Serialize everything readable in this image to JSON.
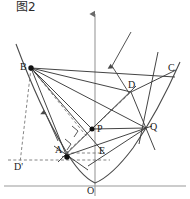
{
  "figure": {
    "caption": "图2",
    "caption_icon": "figure-label-icon",
    "background_color": "#ffffff",
    "stroke_color": "#3a3a3a",
    "axis_color": "#8a8a8a",
    "dash_color": "#6e6e6e",
    "point_color": "#111111",
    "width": 190,
    "height": 199
  },
  "axes": {
    "x_axis": {
      "label": "",
      "y": 186,
      "x_start": 4,
      "x_end": 186
    },
    "y_axis": {
      "label": "",
      "x": 95,
      "y_start": 12,
      "y_end": 196
    },
    "origin": {
      "label": "O",
      "x": 95,
      "y": 186
    }
  },
  "points": [
    {
      "name": "B",
      "label": "B",
      "x": 31,
      "y": 68,
      "dot": true,
      "label_dx": -10,
      "label_dy": -5
    },
    {
      "name": "C",
      "label": "C",
      "x": 166,
      "y": 69,
      "dot": false,
      "label_dx": 3,
      "label_dy": -4
    },
    {
      "name": "D",
      "label": "D",
      "x": 131,
      "y": 92,
      "dot": false,
      "label_dx": -2,
      "label_dy": -13
    },
    {
      "name": "P",
      "label": "P",
      "x": 92,
      "y": 129,
      "dot": true,
      "label_dx": 5,
      "label_dy": -4
    },
    {
      "name": "Q",
      "label": "Q",
      "x": 146,
      "y": 128,
      "dot": false,
      "label_dx": 4,
      "label_dy": -4
    },
    {
      "name": "A",
      "label": "A",
      "x": 66,
      "y": 153,
      "dot": true,
      "label_dx": -11,
      "label_dy": -8
    },
    {
      "name": "E",
      "label": "E",
      "x": 102,
      "y": 152,
      "dot": false,
      "label_dx": 0,
      "label_dy": -4
    },
    {
      "name": "D-prime",
      "label": "D'",
      "x": 18,
      "y": 158,
      "dot": false,
      "label_dx": -2,
      "label_dy": 0
    },
    {
      "name": "O",
      "label": "O",
      "x": 95,
      "y": 186,
      "dot": false,
      "label_dx": -8,
      "label_dy": 2
    }
  ],
  "parabola": {
    "description": "upward-opening parabola with vertex just above origin",
    "vertex_x": 95,
    "vertex_y": 183,
    "path": "M 16 44 Q 40 108 64 148 Q 80 176 95 183 Q 112 176 133 148 Q 158 112 180 62"
  },
  "segments": [
    {
      "name": "line-B-C",
      "from": "B",
      "to": "C",
      "style": "solid"
    },
    {
      "name": "line-B-D",
      "from": "B",
      "to": "D",
      "style": "solid"
    },
    {
      "name": "line-B-Q",
      "from": "B",
      "to": "Q",
      "style": "solid"
    },
    {
      "name": "line-B-P",
      "from": "B",
      "to": "P",
      "style": "solid"
    },
    {
      "name": "line-B-A",
      "from": "B",
      "to": "A",
      "style": "solid"
    },
    {
      "name": "line-B-E",
      "from": "B",
      "to": "E",
      "style": "solid"
    },
    {
      "name": "line-A-Q",
      "from": "A",
      "to": "Q",
      "style": "solid"
    },
    {
      "name": "line-A-D",
      "from": "A",
      "to": "D",
      "style": "solid"
    },
    {
      "name": "line-A-E",
      "from": "A",
      "to": "E",
      "style": "dashed"
    },
    {
      "name": "line-P-Q",
      "from": "P",
      "to": "Q",
      "style": "solid"
    },
    {
      "name": "line-D-Q",
      "from": "D",
      "to": "Q",
      "style": "solid"
    },
    {
      "name": "line-C-Q",
      "from": "C",
      "to": "Q",
      "style": "solid"
    },
    {
      "name": "line-P-D-dash",
      "from": "P",
      "to": "D",
      "style": "dashed"
    },
    {
      "name": "line-B-Dprime",
      "from": "B",
      "to": "D-prime",
      "style": "dashed"
    },
    {
      "name": "line-Dprime-A",
      "from": "D-prime",
      "to": "A",
      "style": "dashed"
    }
  ],
  "marks": {
    "right_angles": [
      {
        "name": "right-angle-upper",
        "x": 77,
        "y": 130
      },
      {
        "name": "right-angle-lower",
        "x": 70,
        "y": 142
      }
    ],
    "arrows": [
      {
        "name": "arrow-along-BA",
        "label": ""
      },
      {
        "name": "arrow-normal-to-directrix",
        "label": ""
      }
    ]
  }
}
